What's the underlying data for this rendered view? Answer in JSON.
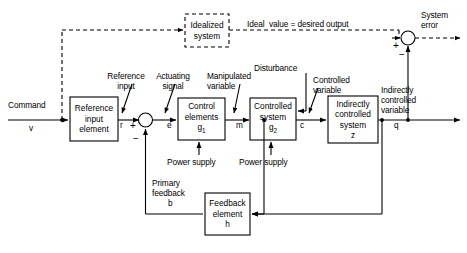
{
  "diagram": {
    "ideal_path_label": "Ideal  value = desired output",
    "system_error_label": "System\nerror",
    "blocks": [
      {
        "id": "reference-input-element",
        "lines": "Reference\ninput\nelement",
        "style": "solid"
      },
      {
        "id": "control-elements",
        "line1": "Control",
        "line2": "elements",
        "line3": "g",
        "sub3": "1",
        "style": "solid"
      },
      {
        "id": "controlled-system",
        "line1": "Controlled",
        "line2": "system",
        "line3": "g",
        "sub3": "2",
        "style": "solid"
      },
      {
        "id": "indirectly-controlled-system",
        "lines": "Indirectly\ncontrolled\nsystem\nz",
        "style": "solid"
      },
      {
        "id": "feedback-element",
        "lines": "Feedback\nelement\nh",
        "style": "solid"
      },
      {
        "id": "idealized-system",
        "lines": "Idealized\nsystem",
        "style": "dashed"
      }
    ],
    "labels": {
      "command": "Command",
      "command_var": "v",
      "reference_input": "Reference\ninput",
      "reference_input_var": "r",
      "actuating_signal": "Actuating\nsignal",
      "actuating_signal_var": "e",
      "manipulated_variable": "Manipulated\nvariable",
      "manipulated_variable_var": "m",
      "disturbance": "Disturbance",
      "controlled_variable": "Controlled\nvariable",
      "controlled_variable_var": "c",
      "indirectly_controlled_variable": "Indirectly\ncontrolled\nvariable",
      "indirectly_controlled_variable_var": "q",
      "primary_feedback": "Primary\nfeedback",
      "primary_feedback_var": "b",
      "power_supply_1": "Power supply",
      "power_supply_2": "Power supply",
      "idealized_system": "Idealized\nsystem",
      "system_error": "System\nerror"
    },
    "signs": {
      "summing_left_plus": "+",
      "summing_left_minus": "−",
      "summing_right_plus": "+",
      "summing_right_minus": "−"
    },
    "colors": {
      "line": "#000000",
      "text": "#000000",
      "background": "#ffffff"
    }
  }
}
